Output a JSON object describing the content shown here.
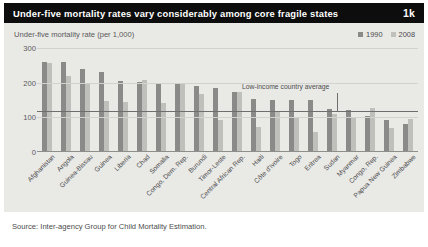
{
  "header": {
    "title": "Under-five mortality rates vary considerably among core fragile states",
    "figure_number": "1k"
  },
  "subtitle": "Under-five mortality rate (per 1,000)",
  "legend": [
    {
      "label": "1990",
      "color": "#8a8a88"
    },
    {
      "label": "2008",
      "color": "#bfbfbb"
    }
  ],
  "annotation": "Low-income country average",
  "source": "Source: Inter-agency Group for Child Mortality Estimation.",
  "chart_data": {
    "type": "bar",
    "title": "Under-five mortality rates vary considerably among core fragile states",
    "subtitle": "Under-five mortality rate (per 1,000)",
    "xlabel": "",
    "ylabel": "Under-five mortality rate (per 1,000)",
    "ylim": [
      0,
      300
    ],
    "yticks": [
      0,
      100,
      200,
      300
    ],
    "grid": true,
    "legend_position": "top-right",
    "reference_line": {
      "label": "Low-income country average",
      "value": 118
    },
    "categories": [
      "Afghanistan",
      "Angola",
      "Guinea-Bissau",
      "Guinea",
      "Liberia",
      "Chad",
      "Somalia",
      "Congo, Dem. Rep.",
      "Burundi",
      "Timor-Leste",
      "Central African Rep.",
      "Haiti",
      "Côte d'Ivoire",
      "Togo",
      "Eritrea",
      "Sudan",
      "Myanmar",
      "Congo, Rep.",
      "Papua New Guinea",
      "Zimbabwe"
    ],
    "series": [
      {
        "name": "1990",
        "color": "#8a8a88",
        "values": [
          260,
          260,
          240,
          230,
          205,
          201,
          200,
          199,
          189,
          184,
          173,
          152,
          151,
          150,
          150,
          124,
          120,
          104,
          91,
          80
        ]
      },
      {
        "name": "2008",
        "color": "#bfbfbb",
        "values": [
          257,
          220,
          195,
          146,
          145,
          209,
          142,
          199,
          168,
          93,
          173,
          72,
          114,
          98,
          58,
          109,
          98,
          127,
          69,
          96
        ]
      }
    ]
  }
}
